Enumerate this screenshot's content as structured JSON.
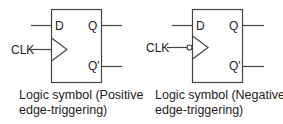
{
  "colors": {
    "stroke": "#444444",
    "text": "#222222",
    "background": "#ffffff"
  },
  "symbols": [
    {
      "type": "D flip-flop",
      "trigger": "positive-edge",
      "pins": {
        "data": "D",
        "clock": "CLK",
        "output": "Q",
        "output_inverted": "Q'"
      },
      "clock_bubble": false,
      "caption_line1": "Logic symbol (Positive",
      "caption_line2": "edge-triggering)"
    },
    {
      "type": "D flip-flop",
      "trigger": "negative-edge",
      "pins": {
        "data": "D",
        "clock": "CLK",
        "output": "Q",
        "output_inverted": "Q'"
      },
      "clock_bubble": true,
      "caption_line1": "Logic symbol (Negative",
      "caption_line2": "edge-triggering)"
    }
  ]
}
